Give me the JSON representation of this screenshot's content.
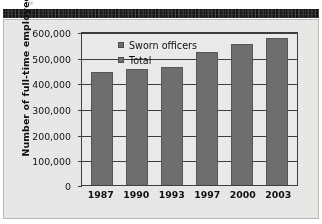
{
  "header": {
    "band_label": ""
  },
  "chart_data": {
    "type": "bar",
    "title": "",
    "xlabel": "",
    "ylabel": "Number of full-time employees",
    "categories": [
      "1987",
      "1990",
      "1993",
      "1997",
      "2000",
      "2003"
    ],
    "values": [
      448000,
      457000,
      465000,
      525000,
      557000,
      580000
    ],
    "series": [
      {
        "name": "Total",
        "values": [
          448000,
          457000,
          465000,
          525000,
          557000,
          580000
        ]
      }
    ],
    "legend": [
      "Sworn officers",
      "Total"
    ],
    "legend_position": "top-left-inside",
    "ylim": [
      0,
      600000
    ],
    "ytick_labels": [
      "600,000",
      "500,000",
      "400,000",
      "300,000",
      "200,000",
      "100,000",
      "0"
    ],
    "ytick_values": [
      600000,
      500000,
      400000,
      300000,
      200000,
      100000,
      0
    ],
    "grid": true,
    "bar_color": "#6e6e6e",
    "plot_background": "#e9e9e7",
    "axis_color": "#3d3d3d"
  }
}
